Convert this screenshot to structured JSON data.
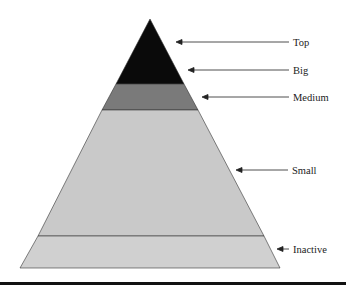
{
  "title": "",
  "tiers": [
    {
      "name": "top",
      "label": "Top",
      "color": "#0a0a0a"
    },
    {
      "name": "big",
      "label": "Big",
      "color": "#0a0a0a"
    },
    {
      "name": "medium",
      "label": "Medium",
      "color": "#7a7a7a"
    },
    {
      "name": "small",
      "label": "Small",
      "color": "#c9c9c9"
    },
    {
      "name": "inactive",
      "label": "Inactive",
      "color": "#d0d0d0"
    }
  ]
}
